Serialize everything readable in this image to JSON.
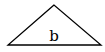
{
  "diagram": {
    "shape": "triangle",
    "label": "b",
    "stroke_color": "#000000",
    "background": "#ffffff"
  }
}
